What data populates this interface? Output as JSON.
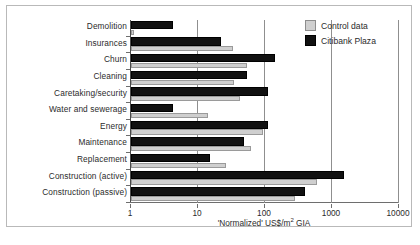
{
  "chart_data": {
    "type": "bar",
    "orientation": "horizontal",
    "title": "",
    "xlabel": "'Normalized' US$/m2 GIA",
    "ylabel": "",
    "xscale": "log",
    "xlim": [
      1,
      10000
    ],
    "xticks": [
      1,
      10,
      100,
      1000,
      10000
    ],
    "xticklabels": [
      "1",
      "10",
      "100",
      "1000",
      "10000"
    ],
    "grid": true,
    "legend_position": "top-right",
    "categories": [
      "Demolition",
      "Insurances",
      "Churn",
      "Cleaning",
      "Caretaking/security",
      "Water and sewerage",
      "Energy",
      "Maintenance",
      "Replacement",
      "Construction (active)",
      "Construction (passive)"
    ],
    "series": [
      {
        "name": "Control data",
        "color": "#cfcfcf",
        "values": [
          1.1,
          33,
          53,
          34,
          42,
          14,
          92,
          62,
          26,
          600,
          280
        ]
      },
      {
        "name": "Citibank Plaza",
        "color": "#111111",
        "values": [
          4.2,
          22,
          140,
          53,
          110,
          4.3,
          110,
          48,
          15,
          1500,
          400
        ]
      }
    ]
  },
  "legend": {
    "entries": [
      {
        "label": "Control data",
        "swatch": "control"
      },
      {
        "label": "Citibank Plaza",
        "swatch": "citibank"
      }
    ]
  },
  "axis": {
    "x_title_prefix": "'Normalized' US$/m",
    "x_title_sup": "2",
    "x_title_suffix": " GIA"
  },
  "caption": ""
}
